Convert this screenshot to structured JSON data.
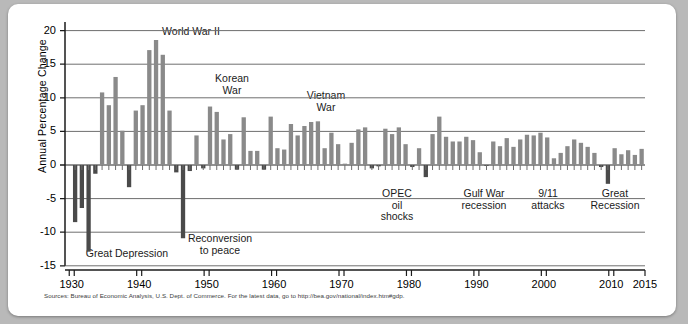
{
  "chart_data": {
    "type": "bar",
    "title": "",
    "xlabel": "",
    "ylabel": "Annual Percentage Change",
    "ylim": [
      -15,
      22
    ],
    "xlim": [
      1929,
      2015
    ],
    "yticks": [
      20,
      15,
      10,
      5,
      0,
      -5,
      -10,
      -15
    ],
    "ytick_labels": [
      "20",
      "15",
      "10",
      "5",
      "0",
      "-5",
      "-10",
      "-15"
    ],
    "xticks": [
      1930,
      1940,
      1950,
      1960,
      1970,
      1980,
      1990,
      2000,
      2010,
      2015
    ],
    "xtick_labels": [
      "1930",
      "1940",
      "1950",
      "1960",
      "1970",
      "1980",
      "1990",
      "2000",
      "2010",
      "2015"
    ],
    "grid": true,
    "gridlines_y": [
      20,
      15,
      10,
      5,
      0,
      -5,
      -10,
      -15
    ],
    "legend": [],
    "bar_color_positive": "#8a8a8a",
    "bar_color_negative": "#4a4a4a",
    "categories": [
      1930,
      1931,
      1932,
      1933,
      1934,
      1935,
      1936,
      1937,
      1938,
      1939,
      1940,
      1941,
      1942,
      1943,
      1944,
      1945,
      1946,
      1947,
      1948,
      1949,
      1950,
      1951,
      1952,
      1953,
      1954,
      1955,
      1956,
      1957,
      1958,
      1959,
      1960,
      1961,
      1962,
      1963,
      1964,
      1965,
      1966,
      1967,
      1968,
      1969,
      1970,
      1971,
      1972,
      1973,
      1974,
      1975,
      1976,
      1977,
      1978,
      1979,
      1980,
      1981,
      1982,
      1983,
      1984,
      1985,
      1986,
      1987,
      1988,
      1989,
      1990,
      1991,
      1992,
      1993,
      1994,
      1995,
      1996,
      1997,
      1998,
      1999,
      2000,
      2001,
      2002,
      2003,
      2004,
      2005,
      2006,
      2007,
      2008,
      2009,
      2010,
      2011,
      2012,
      2013,
      2014
    ],
    "values": [
      -8.5,
      -6.4,
      -12.9,
      -1.3,
      10.8,
      8.9,
      13.1,
      5.1,
      -3.3,
      8.1,
      8.9,
      17.1,
      18.6,
      16.4,
      8.1,
      -1.1,
      -10.9,
      -0.9,
      4.4,
      -0.5,
      8.7,
      7.9,
      3.8,
      4.6,
      -0.7,
      7.1,
      2.1,
      2.1,
      -0.7,
      7.2,
      2.5,
      2.3,
      6.1,
      4.4,
      5.8,
      6.4,
      6.5,
      2.5,
      4.8,
      3.1,
      0.2,
      3.3,
      5.3,
      5.6,
      -0.5,
      -0.2,
      5.4,
      4.6,
      5.6,
      3.1,
      -0.3,
      2.5,
      -1.8,
      4.6,
      7.2,
      4.2,
      3.5,
      3.5,
      4.2,
      3.7,
      1.9,
      -0.1,
      3.5,
      2.8,
      4.0,
      2.7,
      3.8,
      4.5,
      4.4,
      4.8,
      4.1,
      1.0,
      1.8,
      2.8,
      3.8,
      3.3,
      2.7,
      1.8,
      -0.3,
      -2.8,
      2.5,
      1.6,
      2.2,
      1.5,
      2.4
    ],
    "annotations": [
      {
        "id": "world-war-ii",
        "text": "World War II",
        "lines": [
          "World War II"
        ],
        "x_px": 183,
        "y_px": 22
      },
      {
        "id": "korean-war",
        "text": "Korean War",
        "lines": [
          "Korean",
          "War"
        ],
        "x_px": 224,
        "y_px": 69
      },
      {
        "id": "vietnam-war",
        "text": "Vietnam War",
        "lines": [
          "Vietnam",
          "War"
        ],
        "x_px": 318,
        "y_px": 86
      },
      {
        "id": "great-depression",
        "text": "Great Depression",
        "lines": [
          "Great Depression"
        ],
        "x_px": 119,
        "y_px": 244
      },
      {
        "id": "reconversion-to-peace",
        "text": "Reconversion to peace",
        "lines": [
          "Reconversion",
          "to peace"
        ],
        "x_px": 212,
        "y_px": 229
      },
      {
        "id": "opec-oil-shocks",
        "text": "OPEC oil shocks",
        "lines": [
          "OPEC",
          "oil",
          "shocks"
        ],
        "x_px": 389,
        "y_px": 184
      },
      {
        "id": "gulf-war-recession",
        "text": "Gulf War recession",
        "lines": [
          "Gulf War",
          "recession"
        ],
        "x_px": 476,
        "y_px": 184
      },
      {
        "id": "nine-eleven-attacks",
        "text": "9/11 attacks",
        "lines": [
          "9/11",
          "attacks"
        ],
        "x_px": 540,
        "y_px": 184
      },
      {
        "id": "great-recession",
        "text": "Great Recession",
        "lines": [
          "Great",
          "Recession"
        ],
        "x_px": 607,
        "y_px": 184
      }
    ]
  },
  "source": {
    "text": "Sources: Bureau of Economic Analysis, U.S. Dept. of Commerce. For the latest data, go to http://bea.gov/national/index.htm#gdp."
  },
  "colors": {
    "page_background": "#b9b9b9",
    "card_background": "#ffffff",
    "axis": "#1b1b1b",
    "gridline": "#6e6e6e",
    "bar_positive": "#8a8a8a",
    "bar_negative": "#4a4a4a",
    "text": "#1b1b1b"
  }
}
